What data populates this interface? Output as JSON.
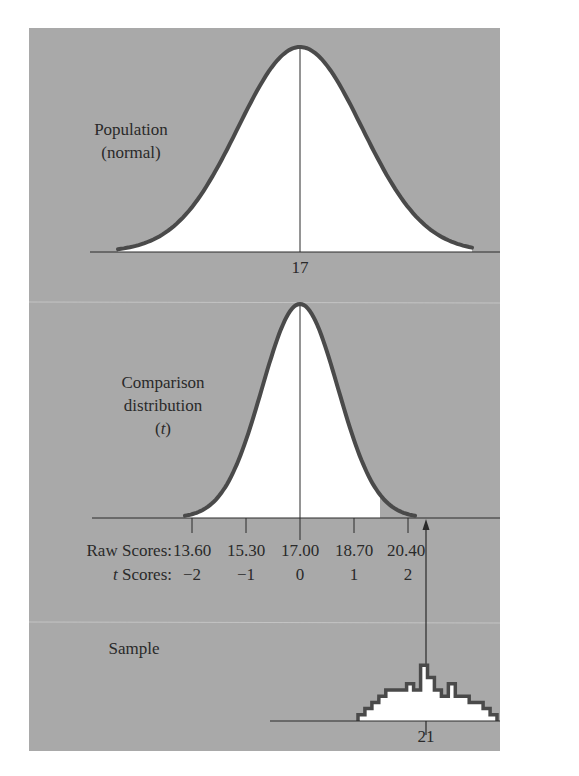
{
  "chart_data": [
    {
      "type": "area",
      "panel": "top",
      "title": "Population (normal)",
      "label_lines": [
        "Population",
        "(normal)"
      ],
      "distribution": "normal",
      "mean": 17,
      "x_tick_labels": [
        "17"
      ],
      "grid": false
    },
    {
      "type": "area",
      "panel": "middle",
      "title": "Comparison distribution (t)",
      "label_lines": [
        "Comparison",
        "distribution",
        "(t)"
      ],
      "distribution": "t",
      "mean": 17.0,
      "standard_error": 1.7,
      "raw_scores_label": "Raw Scores:",
      "raw_scores": [
        "13.60",
        "15.30",
        "17.00",
        "18.70",
        "20.40"
      ],
      "t_scores_label": "t Scores:",
      "t_scores": [
        "−2",
        "−1",
        "0",
        "1",
        "2"
      ],
      "shaded_region": "above t = 1 (unshaded tail beyond cutoff)",
      "marker": {
        "raw_score": 21,
        "description": "arrow from sample mean up to comparison axis"
      },
      "grid": false
    },
    {
      "type": "bar",
      "panel": "bottom",
      "title": "Sample",
      "label_lines": [
        "Sample"
      ],
      "histogram_heights": [
        1,
        2,
        3,
        4,
        5,
        5,
        5,
        6,
        5,
        9,
        7,
        5,
        4,
        6,
        4,
        4,
        3,
        3,
        2,
        1
      ],
      "mean": 21,
      "x_tick_labels": [
        "21"
      ],
      "grid": false
    }
  ],
  "labels": {
    "population_line1": "Population",
    "population_line2": "(normal)",
    "population_mean": "17",
    "comparison_line1": "Comparison",
    "comparison_line2": "distribution",
    "comparison_line3_open": "(",
    "comparison_line3_t": "t",
    "comparison_line3_close": ")",
    "raw_scores_label": "Raw Scores:",
    "t_scores_label_t": "t",
    "t_scores_label_rest": " Scores:",
    "raw_scores": [
      "13.60",
      "15.30",
      "17.00",
      "18.70",
      "20.40"
    ],
    "t_scores": [
      "−2",
      "−1",
      "0",
      "1",
      "2"
    ],
    "sample_label": "Sample",
    "sample_mean": "21"
  },
  "colors": {
    "panel_bg": "#a9a9a9",
    "curve": "#4a4a4a",
    "fill": "#ffffff",
    "axis": "#2a2a2a",
    "text": "#2a2a2a"
  }
}
